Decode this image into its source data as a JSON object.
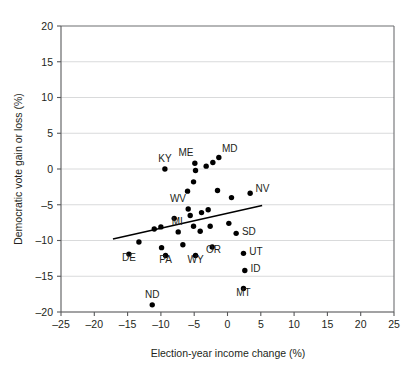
{
  "chart_data": {
    "type": "scatter",
    "title": "",
    "xlabel": "Election-year income change (%)",
    "ylabel": "Democratic vote gain or loss (%)",
    "xlim": [
      -25,
      25
    ],
    "ylim": [
      -20,
      20
    ],
    "xticks": [
      -25,
      -20,
      -15,
      -10,
      -5,
      0,
      5,
      10,
      15,
      20,
      25
    ],
    "yticks": [
      -20,
      -15,
      -10,
      -5,
      0,
      5,
      10,
      15,
      20
    ],
    "xtick_labels": [
      "–25",
      "–20",
      "–15",
      "–10",
      "–5",
      "0",
      "5",
      "10",
      "15",
      "20",
      "25"
    ],
    "ytick_labels": [
      "–20",
      "–15",
      "–10",
      "–5",
      "0",
      "5",
      "10",
      "15",
      "20"
    ],
    "grid": "horizontal",
    "legend": "none",
    "marker_color": "#000000",
    "grid_color": "#d9dadb",
    "axis_color": "#58595b",
    "points": [
      {
        "label": "KY",
        "x": -9.4,
        "y": 0.0,
        "label_dx": 0,
        "label_dy": -5.5
      },
      {
        "label": "ME",
        "x": -4.9,
        "y": 0.8,
        "label_dx": -0.6,
        "label_dy": -5.5
      },
      {
        "label": "MD",
        "x": -1.3,
        "y": 1.6,
        "label_dx": 1.4,
        "label_dy": -4.2
      },
      {
        "label": "NV",
        "x": 3.4,
        "y": -3.4,
        "label_dx": 2.4,
        "label_dy": -1.1
      },
      {
        "label": "WV",
        "x": -5.9,
        "y": -5.6,
        "label_dx": -1.0,
        "label_dy": -5.5
      },
      {
        "label": "MI",
        "x": -7.4,
        "y": -8.8,
        "label_dx": -0.4,
        "label_dy": -5.2
      },
      {
        "label": "SD",
        "x": 1.3,
        "y": -9.0,
        "label_dx": 2.6,
        "label_dy": 1.2
      },
      {
        "label": "UT",
        "x": 2.4,
        "y": -11.8,
        "label_dx": 2.6,
        "label_dy": 1.2
      },
      {
        "label": "DE",
        "x": -14.8,
        "y": -11.9,
        "label_dx": 0,
        "label_dy": 5.4
      },
      {
        "label": "PA",
        "x": -9.3,
        "y": -12.1,
        "label_dx": 0,
        "label_dy": 5.6
      },
      {
        "label": "WY",
        "x": -4.8,
        "y": -12.1,
        "label_dx": 0,
        "label_dy": 5.6
      },
      {
        "label": "OR",
        "x": -2.3,
        "y": -10.9,
        "label_dx": 0.6,
        "label_dy": 4.2
      },
      {
        "label": "ID",
        "x": 2.6,
        "y": -14.2,
        "label_dx": 2.6,
        "label_dy": 1.2
      },
      {
        "label": "MT",
        "x": 2.4,
        "y": -16.7,
        "label_dx": 0,
        "label_dy": 5.6
      },
      {
        "label": "ND",
        "x": -11.3,
        "y": -19.0,
        "label_dx": 0,
        "label_dy": -5.4
      },
      {
        "label": "",
        "x": -4.8,
        "y": -0.2,
        "label_dx": 0,
        "label_dy": 0
      },
      {
        "label": "",
        "x": -3.2,
        "y": 0.4,
        "label_dx": 0,
        "label_dy": 0
      },
      {
        "label": "",
        "x": -2.2,
        "y": 0.9,
        "label_dx": 0,
        "label_dy": 0
      },
      {
        "label": "",
        "x": -5.1,
        "y": -1.8,
        "label_dx": 0,
        "label_dy": 0
      },
      {
        "label": "",
        "x": -6.0,
        "y": -3.1,
        "label_dx": 0,
        "label_dy": 0
      },
      {
        "label": "",
        "x": -1.5,
        "y": -3.0,
        "label_dx": 0,
        "label_dy": 0
      },
      {
        "label": "",
        "x": 0.6,
        "y": -4.0,
        "label_dx": 0,
        "label_dy": 0
      },
      {
        "label": "",
        "x": -5.6,
        "y": -6.5,
        "label_dx": 0,
        "label_dy": 0
      },
      {
        "label": "",
        "x": -2.9,
        "y": -5.7,
        "label_dx": 0,
        "label_dy": 0
      },
      {
        "label": "",
        "x": -3.9,
        "y": -6.1,
        "label_dx": 0,
        "label_dy": 0
      },
      {
        "label": "",
        "x": -8.0,
        "y": -6.9,
        "label_dx": 0,
        "label_dy": 0
      },
      {
        "label": "",
        "x": -11.0,
        "y": -8.4,
        "label_dx": 0,
        "label_dy": 0
      },
      {
        "label": "",
        "x": -10.0,
        "y": -8.1,
        "label_dx": 0,
        "label_dy": 0
      },
      {
        "label": "",
        "x": -5.1,
        "y": -8.0,
        "label_dx": 0,
        "label_dy": 0
      },
      {
        "label": "",
        "x": -4.1,
        "y": -8.7,
        "label_dx": 0,
        "label_dy": 0
      },
      {
        "label": "",
        "x": -2.6,
        "y": -8.0,
        "label_dx": 0,
        "label_dy": 0
      },
      {
        "label": "",
        "x": 0.2,
        "y": -7.6,
        "label_dx": 0,
        "label_dy": 0
      },
      {
        "label": "",
        "x": -13.3,
        "y": -10.2,
        "label_dx": 0,
        "label_dy": 0
      },
      {
        "label": "",
        "x": -9.9,
        "y": -11.0,
        "label_dx": 0,
        "label_dy": 0
      },
      {
        "label": "",
        "x": -6.7,
        "y": -10.6,
        "label_dx": 0,
        "label_dy": 0
      }
    ],
    "trend_line": {
      "x1": -17.2,
      "y1": -9.8,
      "x2": 5.2,
      "y2": -5.1
    }
  }
}
